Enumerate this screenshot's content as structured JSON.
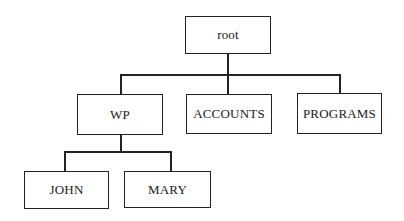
{
  "diagram": {
    "type": "tree",
    "nodes": {
      "root": "root",
      "wp": "WP",
      "accounts": "ACCOUNTS",
      "programs": "PROGRAMS",
      "john": "JOHN",
      "mary": "MARY"
    },
    "edges": [
      [
        "root",
        "WP"
      ],
      [
        "root",
        "ACCOUNTS"
      ],
      [
        "root",
        "PROGRAMS"
      ],
      [
        "WP",
        "JOHN"
      ],
      [
        "WP",
        "MARY"
      ]
    ]
  }
}
